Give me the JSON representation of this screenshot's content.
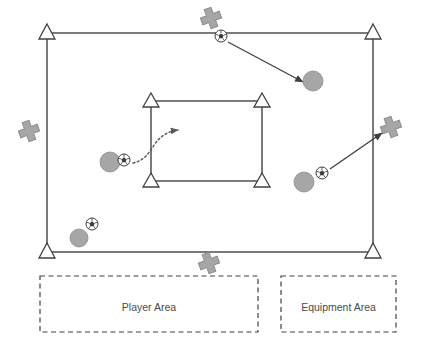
{
  "diagram": {
    "colors": {
      "line": "#595959",
      "cone_fill": "#ffffff",
      "cone_stroke": "#404040",
      "player_fill": "#a6a6a6",
      "player_stroke": "#8c8c8c",
      "marker_fill": "#a6a6a6",
      "marker_stroke": "#8c8c8c",
      "ball_fill": "#ffffff",
      "ball_stroke": "#404040",
      "arrow": "#404040",
      "dashed_box": "#404040",
      "label_text": "#4a4a4a",
      "background": "#ffffff"
    },
    "outer_field": {
      "name": "playing-field",
      "x": 47,
      "y": 33,
      "width": 326,
      "height": 219
    },
    "inner_field": {
      "name": "inner-grid",
      "x": 151,
      "y": 101,
      "width": 111,
      "height": 80
    },
    "cones": [
      {
        "id": "cone-field-top-left",
        "x": 47,
        "y": 33
      },
      {
        "id": "cone-field-top-right",
        "x": 373,
        "y": 33
      },
      {
        "id": "cone-field-bottom-left",
        "x": 47,
        "y": 252
      },
      {
        "id": "cone-field-bottom-right",
        "x": 373,
        "y": 252
      },
      {
        "id": "cone-inner-top-left",
        "x": 151,
        "y": 101
      },
      {
        "id": "cone-inner-top-right",
        "x": 262,
        "y": 101
      },
      {
        "id": "cone-inner-bottom-left",
        "x": 151,
        "y": 181
      },
      {
        "id": "cone-inner-bottom-right",
        "x": 262,
        "y": 181
      }
    ],
    "markers": [
      {
        "id": "marker-top",
        "x": 211,
        "y": 18,
        "rotation": -20
      },
      {
        "id": "marker-left",
        "x": 29,
        "y": 131,
        "rotation": -20
      },
      {
        "id": "marker-right",
        "x": 391,
        "y": 127,
        "rotation": -20
      },
      {
        "id": "marker-bottom",
        "x": 209,
        "y": 263,
        "rotation": -20
      }
    ],
    "players": [
      {
        "id": "player-top-right",
        "x": 313,
        "y": 81,
        "r": 10
      },
      {
        "id": "player-left-center",
        "x": 110,
        "y": 162,
        "r": 10
      },
      {
        "id": "player-bottom-left",
        "x": 79,
        "y": 238,
        "r": 9
      },
      {
        "id": "player-right-low",
        "x": 304,
        "y": 182,
        "r": 10
      }
    ],
    "balls": [
      {
        "id": "ball-top",
        "x": 221,
        "y": 36,
        "r": 6
      },
      {
        "id": "ball-left-center",
        "x": 124,
        "y": 160,
        "r": 6
      },
      {
        "id": "ball-bottom-left",
        "x": 92,
        "y": 224,
        "r": 6
      },
      {
        "id": "ball-right-low",
        "x": 322,
        "y": 173,
        "r": 6
      }
    ],
    "arrows": [
      {
        "id": "pass-arrow-top",
        "style": "solid",
        "from_x": 228,
        "from_y": 42,
        "to_x": 303,
        "to_y": 82
      },
      {
        "id": "pass-arrow-right",
        "style": "solid",
        "from_x": 330,
        "from_y": 169,
        "to_x": 382,
        "to_y": 133
      },
      {
        "id": "dribble-arrow-center",
        "style": "dotted-curved",
        "path": "M 133 163 C 148 160 152 146 158 140 C 164 134 170 131 178 130",
        "to_x": 180,
        "to_y": 130
      }
    ],
    "zones": [
      {
        "id": "player-area",
        "label": "Player Area",
        "x": 40,
        "y": 276,
        "width": 218,
        "height": 56
      },
      {
        "id": "equipment-area",
        "label": "Equipment Area",
        "x": 281,
        "y": 276,
        "width": 115,
        "height": 56
      }
    ]
  }
}
